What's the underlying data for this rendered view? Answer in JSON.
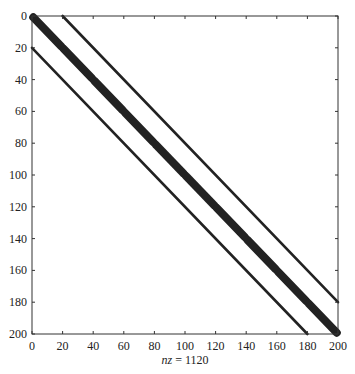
{
  "chart_data": {
    "type": "scatter",
    "subtype": "spy",
    "title": "",
    "xlabel": "nz = 1120",
    "xlabel_parts": {
      "var": "nz",
      "rest": " = 1120"
    },
    "ylabel": "",
    "xlim": [
      0,
      200
    ],
    "ylim": [
      0,
      200
    ],
    "y_reversed": true,
    "grid": false,
    "legend": null,
    "xticks": [
      0,
      20,
      40,
      60,
      80,
      100,
      120,
      140,
      160,
      180,
      200
    ],
    "yticks": [
      0,
      20,
      40,
      60,
      80,
      100,
      120,
      140,
      160,
      180,
      200
    ],
    "nz": 1120,
    "matrix_size": [
      200,
      200
    ],
    "bands": [
      {
        "name": "main-diagonal-block-band",
        "offset": 0,
        "thickness": "thick",
        "block_size": 20,
        "from": [
          1,
          1
        ],
        "to": [
          200,
          200
        ]
      },
      {
        "name": "upper-diagonal",
        "offset": 20,
        "thickness": "thin",
        "from": [
          1,
          21
        ],
        "to": [
          180,
          200
        ]
      },
      {
        "name": "lower-diagonal",
        "offset": -20,
        "thickness": "thin",
        "from": [
          21,
          1
        ],
        "to": [
          200,
          180
        ]
      }
    ],
    "marker_color": "#222222"
  }
}
